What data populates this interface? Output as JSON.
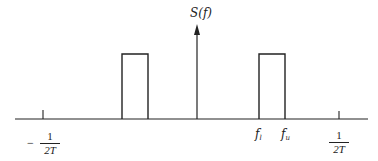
{
  "diagram": {
    "y_axis_label": "S(f)",
    "ticks": {
      "neg_half_rate": {
        "sign": "−",
        "numerator": "1",
        "denominator": "2T"
      },
      "pos_half_rate": {
        "numerator": "1",
        "denominator": "2T"
      },
      "f_lower": {
        "base": "f",
        "sub": "l"
      },
      "f_upper": {
        "base": "f",
        "sub": "u"
      }
    },
    "style": {
      "stroke": "#222222",
      "background": "#ffffff"
    },
    "geometry": {
      "baseline_y": 119,
      "axis_x_start": 15,
      "axis_x_end": 368,
      "center_x": 197,
      "arrow_top_y": 24,
      "rect_top_y": 54,
      "rect_left": {
        "x1": 122,
        "x2": 148
      },
      "rect_right": {
        "x1": 259,
        "x2": 285
      },
      "tick_neg_x": 43,
      "tick_pos_x": 339
    }
  }
}
